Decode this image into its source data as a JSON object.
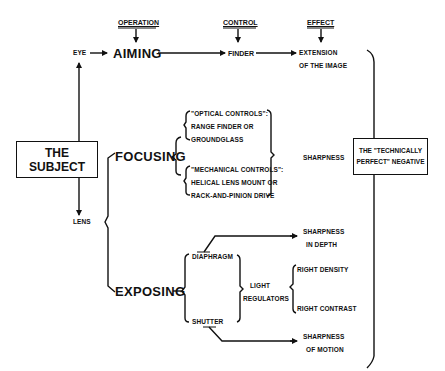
{
  "headers": {
    "operation": "OPERATION",
    "control": "CONTROL",
    "effect": "EFFECT"
  },
  "nodes": {
    "subject": "THE SUBJECT",
    "eye": "EYE",
    "lens": "LENS",
    "aiming": "AIMING",
    "finder": "FINDER",
    "extension_line1": "EXTENSION",
    "extension_line2": "OF THE IMAGE",
    "focusing": "FOCUSING",
    "optical_line1": "\"OPTICAL CONTROLS\":",
    "optical_line2": "RANGE FINDER OR",
    "optical_line3": "GROUNDGLASS",
    "mechanical_line1": "\"MECHANICAL CONTROLS\":",
    "mechanical_line2": "HELICAL LENS MOUNT OR",
    "mechanical_line3": "RACK-AND-PINION DRIVE",
    "sharpness": "SHARPNESS",
    "exposing": "EXPOSING",
    "diaphragm": "DIAPHRAGM",
    "shutter": "SHUTTER",
    "light_line1": "LIGHT",
    "light_line2": "REGULATORS",
    "right_density": "RIGHT DENSITY",
    "right_contrast": "RIGHT CONTRAST",
    "depth_line1": "SHARPNESS",
    "depth_line2": "IN DEPTH",
    "motion_line1": "SHARPNESS",
    "motion_line2": "OF MOTION",
    "negative_line1": "THE \"TECHNICALLY",
    "negative_line2": "PERFECT\" NEGATIVE"
  },
  "colors": {
    "ink": "#111111",
    "paper": "#ffffff"
  }
}
